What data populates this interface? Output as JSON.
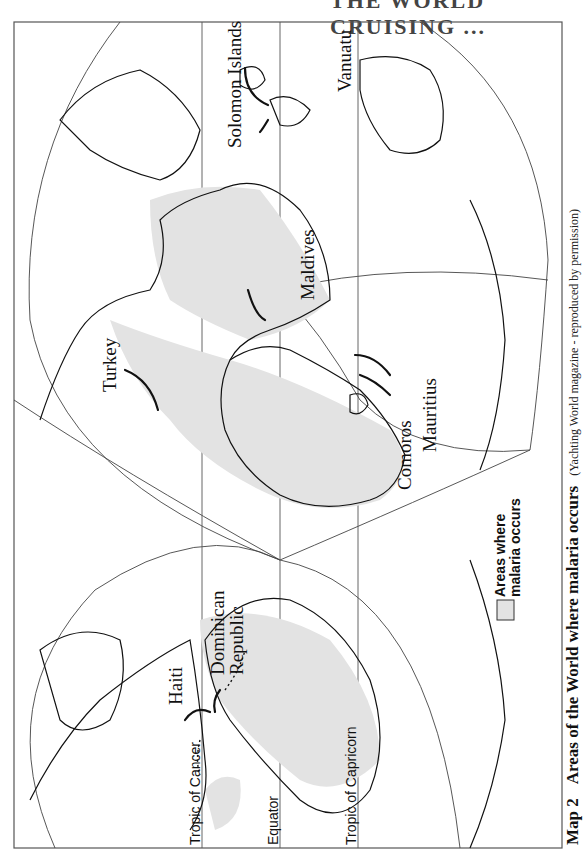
{
  "header": {
    "running_title": "THE WORLD CRUISING ..."
  },
  "map": {
    "orientation": "rotated 90° clockwise (north to the left)",
    "projection": "interrupted two-lobe world projection",
    "colors": {
      "malaria_fill": "#e3e3e3",
      "outline": "#111111",
      "frame": "#555555",
      "background": "#ffffff"
    },
    "reference_lines": [
      {
        "id": "tropic-of-cancer",
        "label": "Tropic of Cancer"
      },
      {
        "id": "equator",
        "label": "Equator"
      },
      {
        "id": "tropic-of-capricorn",
        "label": "Tropic of Capricorn"
      }
    ],
    "places": [
      {
        "id": "haiti",
        "label": "Haiti"
      },
      {
        "id": "dominican-republic",
        "label_line1": "Dominican",
        "label_line2": "Republic"
      },
      {
        "id": "turkey",
        "label": "Turkey"
      },
      {
        "id": "maldives",
        "label": "Maldives"
      },
      {
        "id": "comoros",
        "label": "Comoros"
      },
      {
        "id": "mauritius",
        "label": "Mauritius"
      },
      {
        "id": "solomon-islands",
        "label": "Solomon Islands"
      },
      {
        "id": "vanuatu",
        "label": "Vanuatu"
      }
    ],
    "legend": {
      "line1": "Areas where",
      "line2": "malaria occurs"
    }
  },
  "caption": {
    "number": "Map 2",
    "title": "Areas of the World where malaria occurs",
    "credit": "(Yachting World magazine - reproduced by permission)"
  }
}
